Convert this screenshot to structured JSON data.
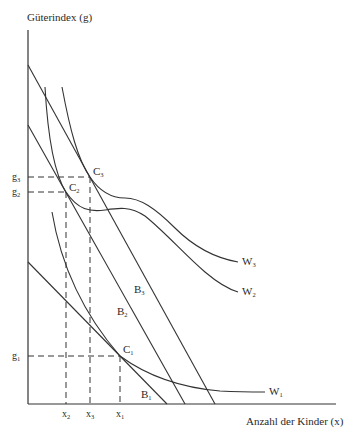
{
  "diagram": {
    "y_axis_label": "Güterindex (g)",
    "x_axis_label": "Anzahl der Kinder (x)",
    "y_ticks": [
      {
        "base": "g",
        "sub": "3"
      },
      {
        "base": "g",
        "sub": "2"
      },
      {
        "base": "g",
        "sub": "1"
      }
    ],
    "x_ticks": [
      {
        "base": "x",
        "sub": "2"
      },
      {
        "base": "x",
        "sub": "3"
      },
      {
        "base": "x",
        "sub": "1"
      }
    ],
    "budget_lines": [
      {
        "base": "B",
        "sub": "3"
      },
      {
        "base": "B",
        "sub": "2"
      },
      {
        "base": "B",
        "sub": "1"
      }
    ],
    "indifference_curves": [
      {
        "base": "W",
        "sub": "3"
      },
      {
        "base": "W",
        "sub": "2"
      },
      {
        "base": "W",
        "sub": "1"
      }
    ],
    "optimum_points": [
      {
        "base": "C",
        "sub": "3"
      },
      {
        "base": "C",
        "sub": "2"
      },
      {
        "base": "C",
        "sub": "1"
      }
    ],
    "line_color": "#333333"
  }
}
